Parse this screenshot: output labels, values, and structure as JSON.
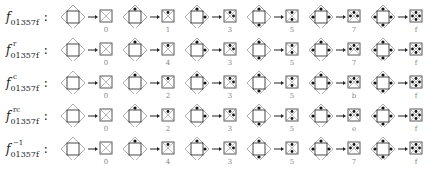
{
  "diagram": {
    "rows": [
      {
        "name": "f",
        "superscript": "",
        "subscript": "01357f",
        "pairs": [
          {
            "dots": [],
            "label": "0"
          },
          {
            "dots": [
              "top"
            ],
            "label": "1"
          },
          {
            "dots": [
              "top",
              "right"
            ],
            "label": "3"
          },
          {
            "dots": [
              "top",
              "bottom"
            ],
            "label": "5"
          },
          {
            "dots": [
              "top",
              "right",
              "left"
            ],
            "label": "7"
          },
          {
            "dots": [
              "top",
              "right",
              "bottom",
              "left"
            ],
            "label": "f"
          }
        ]
      },
      {
        "name": "f",
        "superscript": "r",
        "subscript": "01357f",
        "pairs": [
          {
            "dots": [],
            "label": "0"
          },
          {
            "dots": [
              "top"
            ],
            "label": "4"
          },
          {
            "dots": [
              "top",
              "right"
            ],
            "label": "3"
          },
          {
            "dots": [
              "top",
              "bottom"
            ],
            "label": "5"
          },
          {
            "dots": [
              "top",
              "right",
              "left"
            ],
            "label": "7"
          },
          {
            "dots": [
              "top",
              "right",
              "bottom",
              "left"
            ],
            "label": "f"
          }
        ]
      },
      {
        "name": "f",
        "superscript": "c",
        "subscript": "01357f",
        "pairs": [
          {
            "dots": [],
            "label": "0"
          },
          {
            "dots": [
              "top"
            ],
            "label": "2"
          },
          {
            "dots": [
              "top",
              "right"
            ],
            "label": "3"
          },
          {
            "dots": [
              "top",
              "bottom"
            ],
            "label": "5"
          },
          {
            "dots": [
              "top",
              "right",
              "left"
            ],
            "label": "b"
          },
          {
            "dots": [
              "top",
              "right",
              "bottom",
              "left"
            ],
            "label": "f"
          }
        ]
      },
      {
        "name": "f",
        "superscript": "rc",
        "subscript": "01357f",
        "pairs": [
          {
            "dots": [],
            "label": "0"
          },
          {
            "dots": [
              "top"
            ],
            "label": "2"
          },
          {
            "dots": [
              "top",
              "right"
            ],
            "label": "3"
          },
          {
            "dots": [
              "top",
              "bottom"
            ],
            "label": "5"
          },
          {
            "dots": [
              "top",
              "right",
              "left"
            ],
            "label": "e"
          },
          {
            "dots": [
              "top",
              "right",
              "bottom",
              "left"
            ],
            "label": "f"
          }
        ]
      },
      {
        "name": "f",
        "superscript": "−1",
        "subscript": "01357f",
        "pairs": [
          {
            "dots": [],
            "label": "0"
          },
          {
            "dots": [
              "top"
            ],
            "label": "4"
          },
          {
            "dots": [
              "top",
              "right"
            ],
            "label": "3"
          },
          {
            "dots": [
              "top",
              "bottom"
            ],
            "label": "5"
          },
          {
            "dots": [
              "top",
              "right",
              "left"
            ],
            "label": "7"
          },
          {
            "dots": [
              "top",
              "right",
              "bottom",
              "left"
            ],
            "label": "f"
          }
        ]
      }
    ]
  }
}
